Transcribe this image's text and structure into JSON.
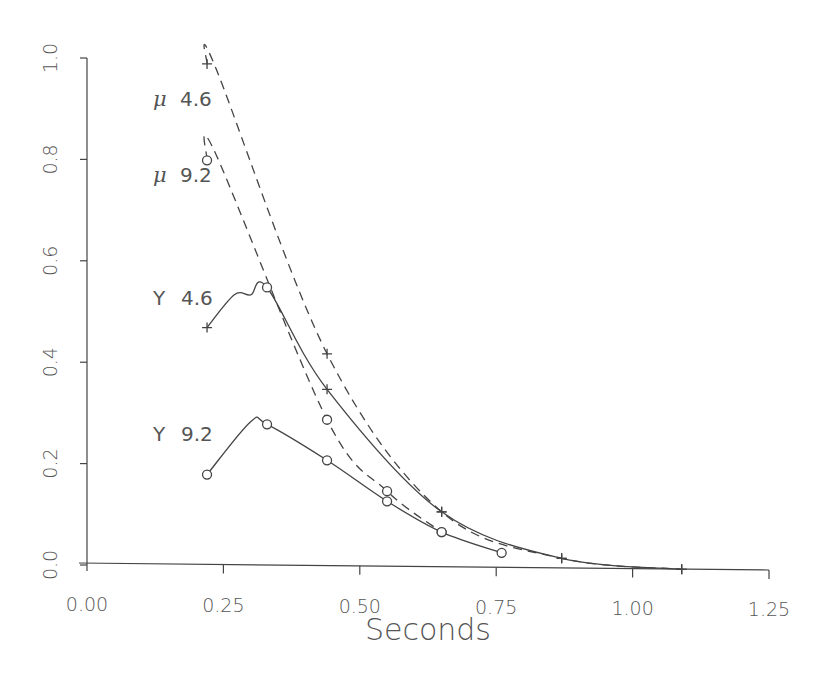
{
  "chart_data": {
    "type": "line",
    "title": "",
    "xlabel": "Seconds",
    "ylabel": "",
    "xlim": [
      0.0,
      1.25
    ],
    "ylim": [
      0.0,
      1.0
    ],
    "x_ticks": [
      "0.00",
      "0.25",
      "0.50",
      "0.75",
      "1.00",
      "1.25"
    ],
    "y_ticks": [
      "0.0",
      "0.2",
      "0.4",
      "0.6",
      "0.8",
      "1.0"
    ],
    "grid": false,
    "legend": "inline labels",
    "series": [
      {
        "name": "μ 4.6",
        "greek": "μ",
        "label_value": "4.6",
        "line_style": "dashed",
        "marker": "plus",
        "x": [
          0.22,
          0.44,
          0.65,
          0.87,
          1.09
        ],
        "values": [
          0.99,
          0.42,
          0.11,
          0.02,
          0.0
        ]
      },
      {
        "name": "μ 9.2",
        "greek": "μ",
        "label_value": "9.2",
        "line_style": "dashed",
        "marker": "circle",
        "x": [
          0.22,
          0.44,
          0.55,
          0.65
        ],
        "values": [
          0.8,
          0.29,
          0.15,
          0.07
        ]
      },
      {
        "name": "Y 4.6",
        "greek": "Y",
        "label_value": "4.6",
        "line_style": "solid",
        "marker": "mixed",
        "x": [
          0.22,
          0.33,
          0.44,
          0.65,
          0.87,
          1.09
        ],
        "values": [
          0.47,
          0.55,
          0.35,
          0.11,
          0.02,
          0.0
        ]
      },
      {
        "name": "Y 9.2",
        "greek": "Y",
        "label_value": "9.2",
        "line_style": "solid",
        "marker": "circle",
        "x": [
          0.22,
          0.33,
          0.44,
          0.55,
          0.65,
          0.76
        ],
        "values": [
          0.18,
          0.28,
          0.21,
          0.13,
          0.07,
          0.03
        ]
      }
    ],
    "colors": {
      "ink": "#444444",
      "text": "#555555",
      "background": "#ffffff"
    }
  }
}
